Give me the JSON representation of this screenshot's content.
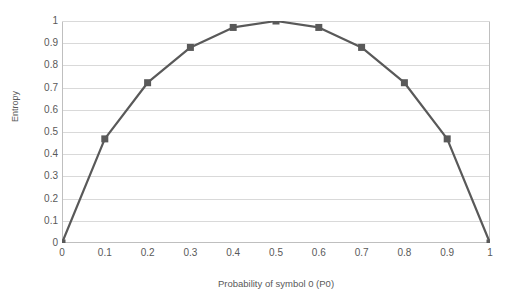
{
  "chart_data": {
    "type": "line",
    "title": "",
    "xlabel": "Probability of symbol 0 (P0)",
    "ylabel": "Entropy",
    "x": [
      0,
      0.1,
      0.2,
      0.3,
      0.4,
      0.5,
      0.6,
      0.7,
      0.8,
      0.9,
      1
    ],
    "values": [
      0,
      0.469,
      0.722,
      0.881,
      0.971,
      1,
      0.971,
      0.881,
      0.722,
      0.469,
      0
    ],
    "series": [
      {
        "name": "Entropy",
        "values": [
          0,
          0.469,
          0.722,
          0.881,
          0.971,
          1,
          0.971,
          0.881,
          0.722,
          0.469,
          0
        ]
      }
    ],
    "xlim": [
      0,
      1
    ],
    "ylim": [
      0,
      1
    ],
    "xticks": [
      "0",
      "0.1",
      "0.2",
      "0.3",
      "0.4",
      "0.5",
      "0.6",
      "0.7",
      "0.8",
      "0.9",
      "1"
    ],
    "yticks": [
      "0",
      "0.1",
      "0.2",
      "0.3",
      "0.4",
      "0.5",
      "0.6",
      "0.7",
      "0.8",
      "0.9",
      "1"
    ],
    "ytick_values": [
      0,
      0.1,
      0.2,
      0.3,
      0.4,
      0.5,
      0.6,
      0.7,
      0.8,
      0.9,
      1
    ],
    "grid": {
      "horizontal": true,
      "vertical": false,
      "color": "#d9d9d9"
    },
    "legend": {
      "visible": false,
      "position": "none",
      "entries": []
    },
    "marker": {
      "shape": "square",
      "size": 7,
      "color": "#595959"
    },
    "line": {
      "color": "#595959",
      "width": 2.2
    },
    "axis_line_color": "#bfbfbf",
    "background_color": "#ffffff",
    "text_color": "#595959"
  }
}
